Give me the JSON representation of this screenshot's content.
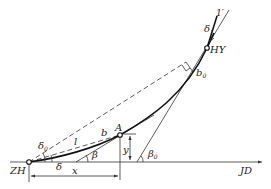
{
  "diagram": {
    "title": "",
    "labels": {
      "zh": "ZH",
      "hy": "HY",
      "jd": "JD",
      "a": "A",
      "x": "x",
      "y": "y",
      "l": "l",
      "b": "b",
      "b0_main": "b",
      "b0_sub": "0",
      "delta": "δ",
      "delta0_main": "δ",
      "delta0_sub": "0",
      "beta": "β",
      "beta0_main": "β",
      "beta0_sub": "0",
      "delta1_main": "δ",
      "delta1_sub": "1",
      "one_prime": "1′"
    },
    "colors": {
      "line": "#333333",
      "curve": "#111111",
      "background": "#ffffff"
    }
  }
}
